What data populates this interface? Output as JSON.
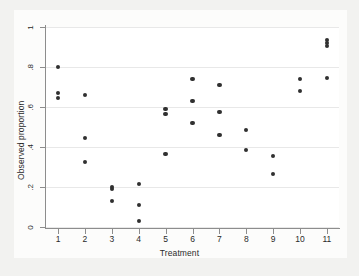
{
  "chart": {
    "type": "scatter",
    "title": "",
    "xlabel": "Treatment",
    "ylabel": "Observed proportion",
    "background_color": "#ffffff",
    "frame_color": "#f2f2f0",
    "marker_color": "#303030",
    "gridline_color": "#e8e8e8",
    "axis_color": "#8d8d8d",
    "grid": "horizontal",
    "legend": "none"
  },
  "chart_data": {
    "type": "scatter",
    "title": "",
    "xlabel": "Treatment",
    "ylabel": "Observed proportion",
    "xlim": [
      0.55,
      11.45
    ],
    "ylim": [
      0,
      1
    ],
    "xticks": [
      1,
      2,
      3,
      4,
      5,
      6,
      7,
      8,
      9,
      10,
      11
    ],
    "xticklabels": [
      "1",
      "2",
      "3",
      "4",
      "5",
      "6",
      "7",
      "8",
      "9",
      "10",
      "11"
    ],
    "yticks": [
      0,
      0.2,
      0.4,
      0.6,
      0.8,
      1
    ],
    "yticklabels": [
      "0",
      ".2",
      ".4",
      ".6",
      ".8",
      "1"
    ],
    "grid": "horizontal",
    "legend": "none",
    "points": [
      {
        "x": 1,
        "y": 0.8
      },
      {
        "x": 1,
        "y": 0.67
      },
      {
        "x": 1,
        "y": 0.645
      },
      {
        "x": 2,
        "y": 0.66
      },
      {
        "x": 2,
        "y": 0.445
      },
      {
        "x": 2,
        "y": 0.325
      },
      {
        "x": 3,
        "y": 0.2
      },
      {
        "x": 3,
        "y": 0.19
      },
      {
        "x": 3,
        "y": 0.13
      },
      {
        "x": 4,
        "y": 0.215
      },
      {
        "x": 4,
        "y": 0.11
      },
      {
        "x": 4,
        "y": 0.03
      },
      {
        "x": 5,
        "y": 0.59
      },
      {
        "x": 5,
        "y": 0.565
      },
      {
        "x": 5,
        "y": 0.365
      },
      {
        "x": 6,
        "y": 0.74
      },
      {
        "x": 6,
        "y": 0.63
      },
      {
        "x": 6,
        "y": 0.52
      },
      {
        "x": 7,
        "y": 0.71
      },
      {
        "x": 7,
        "y": 0.575
      },
      {
        "x": 7,
        "y": 0.46
      },
      {
        "x": 8,
        "y": 0.485
      },
      {
        "x": 8,
        "y": 0.385
      },
      {
        "x": 9,
        "y": 0.355
      },
      {
        "x": 9,
        "y": 0.265
      },
      {
        "x": 10,
        "y": 0.74
      },
      {
        "x": 10,
        "y": 0.68
      },
      {
        "x": 11,
        "y": 0.935
      },
      {
        "x": 11,
        "y": 0.92
      },
      {
        "x": 11,
        "y": 0.905
      },
      {
        "x": 11,
        "y": 0.745
      }
    ]
  }
}
